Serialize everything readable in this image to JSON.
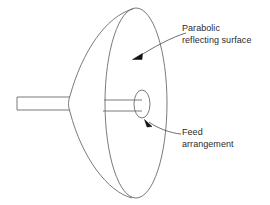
{
  "figure": {
    "background_color": "#ffffff",
    "stroke_color": "#6b6b6b",
    "text_color": "#2b2b2b",
    "parts": {
      "dish": {
        "name": "parabolic-dish",
        "rim_ellipse": {
          "cx": 136,
          "cy": 103,
          "rx": 31,
          "ry": 95
        },
        "back_curve_leftmost_x": 68
      },
      "feed": {
        "name": "feed-horn",
        "ellipse": {
          "cx": 142,
          "cy": 104,
          "rx": 8,
          "ry": 14
        }
      },
      "rod_outer": {
        "name": "support-rod-outer",
        "x1": 17,
        "y1": 97,
        "x2": 68,
        "y2": 110
      },
      "rod_inner": {
        "name": "support-rod-inner",
        "x1": 105,
        "y1": 100,
        "x2": 142,
        "y2": 111
      }
    }
  },
  "annotations": {
    "parabolic": {
      "icon": "arrow-leader-icon",
      "line1": "Parabolic",
      "line2": "reflecting surface",
      "arrow_tip": {
        "x": 133,
        "y": 59
      },
      "arrow_tail": {
        "x": 186,
        "y": 33
      }
    },
    "feed": {
      "icon": "arrow-leader-icon",
      "line1": "Feed",
      "line2": "arrangement",
      "arrow_tip": {
        "x": 145,
        "y": 120
      },
      "arrow_tail": {
        "x": 181,
        "y": 134
      }
    }
  }
}
